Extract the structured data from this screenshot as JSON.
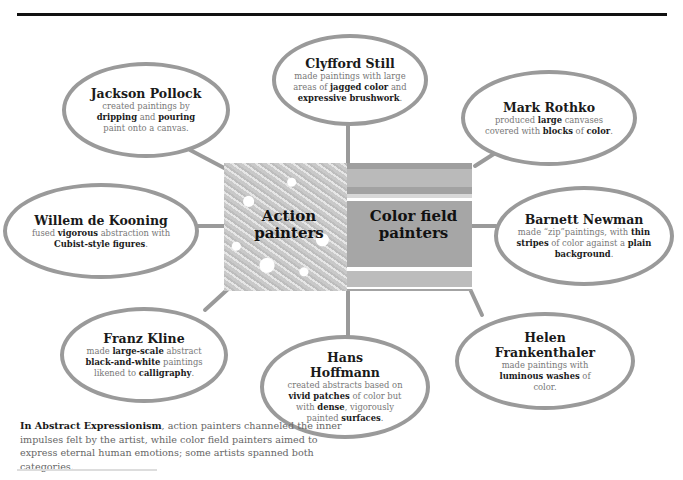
{
  "diagram": {
    "center": {
      "left_label": "Action painters",
      "left_label_line1": "Action",
      "left_label_line2": "painters",
      "right_label": "Color field painters",
      "right_label_line1": "Color field",
      "right_label_line2": "painters"
    },
    "artists": [
      {
        "id": "clyfford-still",
        "name": "Clyfford Still",
        "group": "both",
        "desc_parts": [
          "made paintings with large areas of ",
          "jagged color",
          " and ",
          "expressive brushwork",
          "."
        ]
      },
      {
        "id": "jackson-pollock",
        "name": "Jackson Pollock",
        "group": "action",
        "desc_parts": [
          "created paintings by ",
          "dripping",
          " and ",
          "pouring",
          " paint onto a canvas."
        ]
      },
      {
        "id": "mark-rothko",
        "name": "Mark Rothko",
        "group": "color-field",
        "desc_parts": [
          "produced ",
          "large",
          " canvases covered with ",
          "blocks",
          " of ",
          "color",
          "."
        ]
      },
      {
        "id": "willem-de-kooning",
        "name": "Willem de Kooning",
        "group": "action",
        "desc_parts": [
          "fused ",
          "vigorous",
          " abstraction with ",
          "Cubist-style figures",
          "."
        ]
      },
      {
        "id": "barnett-newman",
        "name": "Barnett Newman",
        "group": "color-field",
        "desc_parts": [
          "made “zip”paintings, with ",
          "thin stripes",
          " of color against a ",
          "plain background",
          "."
        ]
      },
      {
        "id": "franz-kline",
        "name": "Franz Kline",
        "group": "action",
        "desc_parts": [
          "made ",
          "large-scale",
          " abstract ",
          "black-and-white",
          " paintings likened to ",
          "calligraphy",
          "."
        ]
      },
      {
        "id": "hans-hoffmann",
        "name": "Hans Hoffmann",
        "group": "both",
        "desc_parts": [
          "created abstracts based on ",
          "vivid patches",
          " of color but with ",
          "dense",
          ", vigorously painted ",
          "surfaces",
          "."
        ]
      },
      {
        "id": "helen-frankenthaler",
        "name": "Helen Frankenthaler",
        "group": "color-field",
        "desc_parts": [
          "made paintings with ",
          "luminous washes",
          " of color."
        ]
      }
    ],
    "footnote": {
      "bold": "In Abstract Expressionism",
      "text": ", action painters channeled the inner impulses felt by the artist, while color field painters aimed to express eternal human emotions; some artists spanned both categories."
    },
    "colors": {
      "bubble_border": "#9a9a9a",
      "connector": "#9a9a9a",
      "title_text": "#1a1a1a",
      "body_text": "#777777",
      "rule": "#111111"
    }
  }
}
